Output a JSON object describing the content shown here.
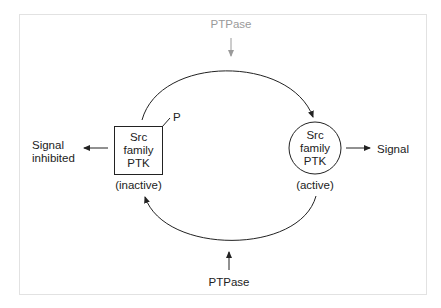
{
  "diagram": {
    "frame_color": "#e2e2e2",
    "ink_color": "#222222",
    "faded_color": "#9a9a9a",
    "top_enzyme": {
      "label": "PTPase",
      "style": "faded"
    },
    "bottom_enzyme": {
      "label": "PTPase",
      "style": "normal"
    },
    "inactive_form": {
      "shape": "square",
      "lines": [
        "Src",
        "family",
        "PTK"
      ],
      "state_label": "(inactive)",
      "phospho_label": "P"
    },
    "active_form": {
      "shape": "circle",
      "lines": [
        "Src",
        "family",
        "PTK"
      ],
      "state_label": "(active)"
    },
    "left_output": {
      "lines": [
        "Signal",
        "inhibited"
      ]
    },
    "right_output": {
      "label": "Signal"
    }
  }
}
